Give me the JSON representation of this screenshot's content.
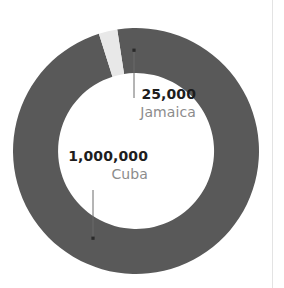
{
  "chart_data": {
    "type": "pie",
    "variant": "donut",
    "title": "",
    "subtitle": "",
    "xlabel": "",
    "ylabel": "",
    "legend_position": "none",
    "grid": false,
    "labels_inline": true,
    "total": 1025000,
    "categories": [
      "Cuba",
      "Jamaica"
    ],
    "values": [
      1000000,
      25000
    ],
    "value_labels": [
      "1,000,000",
      "25,000"
    ],
    "colors": [
      "#595959",
      "#e8e8e8"
    ],
    "slices": [
      {
        "name": "Cuba",
        "value": 1000000,
        "value_label": "1,000,000",
        "color": "#595959",
        "percent": 97.6
      },
      {
        "name": "Jamaica",
        "value": 25000,
        "value_label": "25,000",
        "color": "#e8e8e8",
        "percent": 2.4
      }
    ]
  },
  "annotations": {
    "jamaica": {
      "value": "25,000",
      "name": "Jamaica"
    },
    "cuba": {
      "value": "1,000,000",
      "name": "Cuba"
    }
  },
  "colors": {
    "background": "#ffffff",
    "ring_major": "#595959",
    "ring_minor": "#e8e8e8",
    "value_text": "#1d1d1d",
    "name_text": "#8c8c8c",
    "leader_line": "#6b6b6b",
    "divider_rule": "#e3e3e3"
  }
}
